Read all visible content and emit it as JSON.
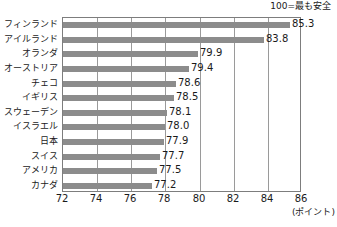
{
  "header": {
    "note": "100=最も安全"
  },
  "axis": {
    "unit_label": "(ポイント)",
    "ticks": [
      "72",
      "74",
      "76",
      "78",
      "80",
      "82",
      "84",
      "86"
    ]
  },
  "colors": {
    "bar": "#8c8c8c",
    "gridline": "#9a9a9a",
    "frame": "#7d7d7d",
    "text": "#1a1a1a",
    "background": "#ffffff"
  },
  "chart_data": {
    "type": "bar",
    "orientation": "horizontal",
    "title": "",
    "subtitle": "",
    "annotation": "100=最も安全",
    "xlabel": "(ポイント)",
    "ylabel": "",
    "xlim": [
      72,
      86
    ],
    "xticks": [
      72,
      74,
      76,
      78,
      80,
      82,
      84,
      86
    ],
    "grid": true,
    "legend": false,
    "categories": [
      "フィンランド",
      "アイルランド",
      "オランダ",
      "オーストリア",
      "チェコ",
      "イギリス",
      "スウェーデン",
      "イスラエル",
      "日本",
      "スイス",
      "アメリカ",
      "カナダ"
    ],
    "values": [
      85.3,
      83.8,
      79.9,
      79.4,
      78.6,
      78.5,
      78.1,
      78.0,
      77.9,
      77.7,
      77.5,
      77.2
    ],
    "value_labels": [
      "85.3",
      "83.8",
      "79.9",
      "79.4",
      "78.6",
      "78.5",
      "78.1",
      "78.0",
      "77.9",
      "77.7",
      "77.5",
      "77.2"
    ]
  }
}
